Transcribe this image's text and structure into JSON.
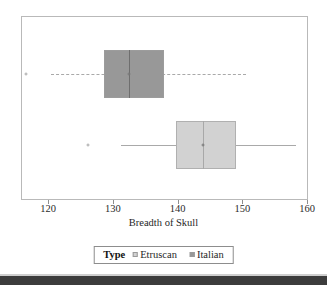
{
  "axis": {
    "xlabel": "Breadth of Skull",
    "ticks": [
      {
        "value": 120,
        "label": "120"
      },
      {
        "value": 130,
        "label": "130"
      },
      {
        "value": 140,
        "label": "140"
      },
      {
        "value": 150,
        "label": "150"
      },
      {
        "value": 160,
        "label": "160"
      }
    ]
  },
  "legend": {
    "title": "Type",
    "entries": [
      {
        "label": "Etruscan",
        "color": "#d2d2d2"
      },
      {
        "label": "Italian",
        "color": "#989898"
      }
    ]
  },
  "colors": {
    "italian_fill": "#989898",
    "etruscan_fill": "#d2d2d2",
    "frame": "#b9b9b9",
    "whisker": "#a9a9a9"
  },
  "chart_data": {
    "type": "box",
    "title": "",
    "xlabel": "Breadth of Skull",
    "ylabel": "",
    "xlim": [
      115,
      160
    ],
    "grid": false,
    "orientation": "horizontal",
    "legend_position": "bottom",
    "legend_title": "Type",
    "series": [
      {
        "name": "Italian",
        "color": "#989898",
        "whisker_style": "dashed",
        "row": 1,
        "q1": 128.5,
        "median": 132.4,
        "q3": 137.7,
        "whisker_low": 120.3,
        "whisker_high": 150.5,
        "outliers": [
          116.5
        ]
      },
      {
        "name": "Etruscan",
        "color": "#d2d2d2",
        "whisker_style": "solid",
        "row": 2,
        "q1": 139.6,
        "median": 143.8,
        "q3": 148.9,
        "whisker_low": 131.1,
        "whisker_high": 158.2,
        "outliers": [
          126.0
        ]
      }
    ]
  }
}
